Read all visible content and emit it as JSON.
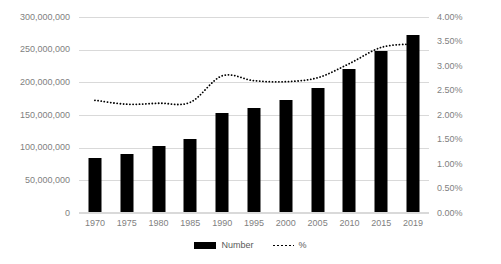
{
  "chart_data": {
    "type": "bar",
    "title": "",
    "subtitle": "",
    "xlabel": "",
    "ylabel": "",
    "categories": [
      "1970",
      "1975",
      "1980",
      "1985",
      "1990",
      "1995",
      "2000",
      "2005",
      "2010",
      "2015",
      "2019"
    ],
    "series": [
      {
        "name": "Number",
        "type": "bar",
        "axis": "left",
        "color": "#000000",
        "values": [
          84000000,
          90000000,
          102000000,
          113000000,
          153000000,
          161000000,
          173000000,
          191000000,
          220000000,
          248000000,
          272000000
        ]
      },
      {
        "name": "%",
        "type": "line",
        "style": "dotted",
        "axis": "right",
        "color": "#000000",
        "values": [
          2.3,
          2.22,
          2.24,
          2.26,
          2.8,
          2.7,
          2.68,
          2.76,
          3.05,
          3.38,
          3.45
        ]
      }
    ],
    "left_axis": {
      "min": 0,
      "max": 300000000,
      "step": 50000000,
      "ticks": [
        "0",
        "50,000,000",
        "100,000,000",
        "150,000,000",
        "200,000,000",
        "250,000,000",
        "300,000,000"
      ]
    },
    "right_axis": {
      "min": 0,
      "max": 4.0,
      "step": 0.5,
      "ticks": [
        "0.00%",
        "0.50%",
        "1.00%",
        "1.50%",
        "2.00%",
        "2.50%",
        "3.00%",
        "3.50%",
        "4.00%"
      ]
    },
    "grid": true,
    "legend": {
      "position": "bottom",
      "entries": [
        {
          "label": "Number",
          "marker": "bar-swatch"
        },
        {
          "label": "%",
          "marker": "dotted-line-swatch"
        }
      ]
    },
    "colors": {
      "bar": "#000000",
      "line": "#000000",
      "grid": "#d9d9d9",
      "tick_text": "#7f7f7f",
      "legend_text": "#595959",
      "background": "#ffffff"
    }
  }
}
